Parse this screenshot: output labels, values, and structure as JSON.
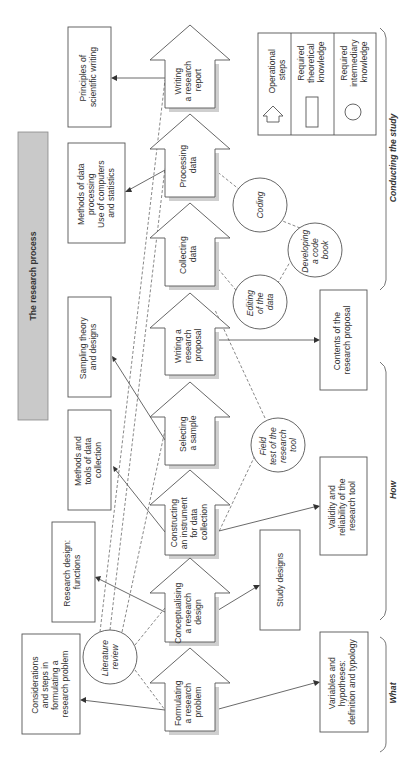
{
  "title": "The research process",
  "colors": {
    "title_bar": "#c9c9c9",
    "stroke": "#555555",
    "shadow": "#cfcfcf"
  },
  "operational_steps": [
    {
      "id": "formulating",
      "lines": [
        "Formulating",
        "a research",
        "problem"
      ]
    },
    {
      "id": "conceptualising",
      "lines": [
        "Conceptualising",
        "a research",
        "design"
      ]
    },
    {
      "id": "constructing",
      "lines": [
        "Constructing",
        "an instrument",
        "for data",
        "collection"
      ]
    },
    {
      "id": "selecting",
      "lines": [
        "Selecting",
        "a sample"
      ]
    },
    {
      "id": "proposal",
      "lines": [
        "Writing a",
        "research",
        "proposal"
      ]
    },
    {
      "id": "collecting",
      "lines": [
        "Collecting",
        "data"
      ]
    },
    {
      "id": "processing",
      "lines": [
        "Processing",
        "data"
      ]
    },
    {
      "id": "report",
      "lines": [
        "Writing",
        "a research",
        "report"
      ]
    }
  ],
  "theoretical_knowledge": [
    {
      "id": "considerations",
      "lines": [
        "Considerations",
        "and steps in",
        "formulating a",
        "research problem"
      ]
    },
    {
      "id": "research_design",
      "lines": [
        "Research design:",
        "functions"
      ]
    },
    {
      "id": "methods_tools",
      "lines": [
        "Methods and",
        "tools of data",
        "collection"
      ]
    },
    {
      "id": "sampling",
      "lines": [
        "Sampling theory",
        "and designs"
      ]
    },
    {
      "id": "methods_processing",
      "lines": [
        "Methods of data",
        "processing",
        "Use of computers",
        "and statistics"
      ]
    },
    {
      "id": "principles",
      "lines": [
        "Principles of",
        "scientific writing"
      ]
    },
    {
      "id": "variables",
      "lines": [
        "Variables and",
        "hypotheses:",
        "definition and typology"
      ]
    },
    {
      "id": "study_designs",
      "lines": [
        "Study designs"
      ]
    },
    {
      "id": "validity",
      "lines": [
        "Validity and",
        "reliability of the",
        "research tool"
      ]
    },
    {
      "id": "contents",
      "lines": [
        "Contents of the",
        "research proposal"
      ]
    }
  ],
  "intermediary_knowledge": [
    {
      "id": "literature",
      "lines": [
        "Literature",
        "review"
      ]
    },
    {
      "id": "field_test",
      "lines": [
        "Field",
        "test of the",
        "research",
        "tool"
      ]
    },
    {
      "id": "editing",
      "lines": [
        "Editing",
        "of the",
        "data"
      ]
    },
    {
      "id": "developing",
      "lines": [
        "Developing",
        "a code",
        "book"
      ]
    },
    {
      "id": "coding",
      "lines": [
        "Coding"
      ]
    }
  ],
  "legend": {
    "items": [
      {
        "icon": "arrow-shape",
        "lines": [
          "Operational",
          "steps"
        ]
      },
      {
        "icon": "rectangle-shape",
        "lines": [
          "Required",
          "theoretical",
          "knowledge"
        ]
      },
      {
        "icon": "circle-shape",
        "lines": [
          "Required",
          "intermediary",
          "knowledge"
        ]
      }
    ]
  },
  "phases": [
    {
      "label": "What"
    },
    {
      "label": "How"
    },
    {
      "label": "Conducting the study"
    }
  ]
}
